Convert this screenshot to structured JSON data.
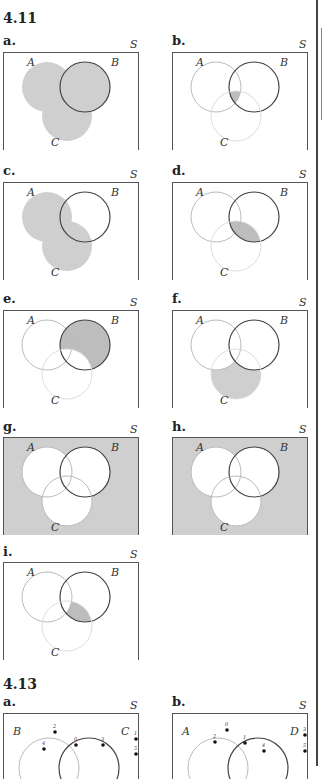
{
  "sections": [
    {
      "title": "4.11"
    },
    {
      "title": "4.13"
    }
  ],
  "set_labels": {
    "A": "A",
    "B": "B",
    "C": "C",
    "D": "D",
    "universe": "S"
  },
  "colors": {
    "shade": "#cfcfcf",
    "shade_dark": "#bdbdbd",
    "border": "#555555",
    "light_circle": "#bbbbbb",
    "dark_circle": "#444444",
    "box": "#555555"
  },
  "ex_4_11": {
    "panels": [
      {
        "label": "a.",
        "shaded": "A ∪ B ∪ C"
      },
      {
        "label": "b.",
        "shaded": "A ∩ B ∩ C"
      },
      {
        "label": "c.",
        "shaded": "A ∪ C"
      },
      {
        "label": "d.",
        "shaded": "B ∩ C"
      },
      {
        "label": "e.",
        "shaded": "B ∖ C"
      },
      {
        "label": "f.",
        "shaded": "C ∖ (A ∪ B)"
      },
      {
        "label": "g.",
        "shaded": "(A ∪ B ∪ C)ᶜ"
      },
      {
        "label": "h.",
        "shaded": "(A ∪ B ∪ C)ᶜ"
      },
      {
        "label": "i.",
        "shaded": "(B ∩ C) ∖ A"
      }
    ]
  },
  "ex_4_13": {
    "panels": [
      {
        "label": "a.",
        "left_set": "B",
        "right_set": "C",
        "points": [
          "2",
          "4",
          "0",
          "3",
          "1",
          "5"
        ]
      },
      {
        "label": "b.",
        "left_set": "A",
        "right_set": "D",
        "points": [
          "0",
          "2",
          "1",
          "4",
          "3",
          "5"
        ]
      }
    ]
  }
}
